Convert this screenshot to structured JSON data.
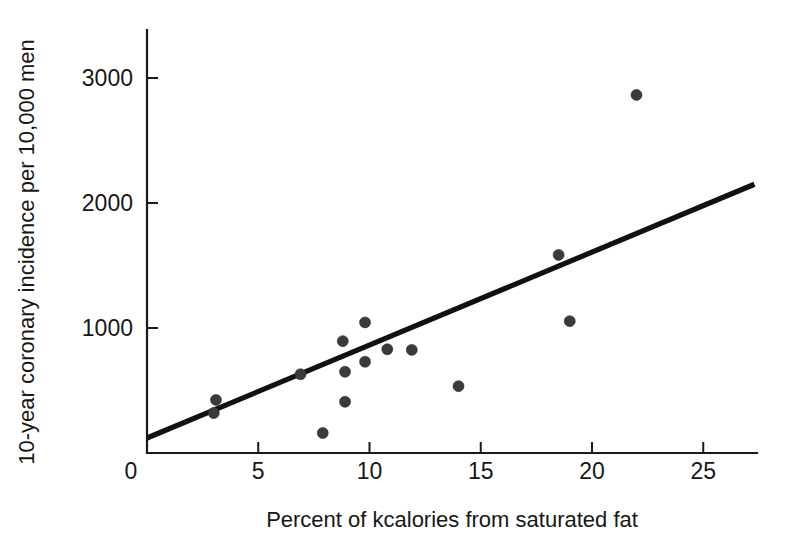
{
  "chart_data": {
    "type": "scatter",
    "title": "",
    "subtitle": "",
    "xlabel": "Percent of kcalories from saturated fat",
    "ylabel": "10-year coronary incidence per 10,000 men",
    "xlim": [
      0,
      27.3
    ],
    "ylim": [
      0,
      3400
    ],
    "xticks": [
      0,
      5,
      10,
      15,
      20,
      25
    ],
    "xtick_labels": [
      "0",
      "5",
      "10",
      "15",
      "20",
      "25"
    ],
    "yticks": [
      1000,
      2000,
      3000
    ],
    "ytick_labels": [
      "1000",
      "2000",
      "3000"
    ],
    "grid": false,
    "legend": null,
    "legend_position": "none",
    "marker": {
      "shape": "circle",
      "color": "#3b3b3b",
      "size_px": 11
    },
    "points": [
      {
        "x": 3.1,
        "y": 425
      },
      {
        "x": 3.0,
        "y": 320
      },
      {
        "x": 6.9,
        "y": 630
      },
      {
        "x": 7.9,
        "y": 160
      },
      {
        "x": 8.8,
        "y": 895
      },
      {
        "x": 8.9,
        "y": 650
      },
      {
        "x": 8.9,
        "y": 410
      },
      {
        "x": 9.8,
        "y": 1045
      },
      {
        "x": 9.8,
        "y": 730
      },
      {
        "x": 10.8,
        "y": 830
      },
      {
        "x": 11.9,
        "y": 825
      },
      {
        "x": 14.0,
        "y": 535
      },
      {
        "x": 18.5,
        "y": 1585
      },
      {
        "x": 19.0,
        "y": 1055
      },
      {
        "x": 22.0,
        "y": 2865
      }
    ],
    "trendline": {
      "type": "linear-fit",
      "color": "#111111",
      "x_start": 0.0,
      "y_start": 120,
      "x_end": 27.3,
      "y_end": 2150
    }
  },
  "axes": {
    "x_axis_name": "x-axis",
    "y_axis_name": "y-axis"
  }
}
